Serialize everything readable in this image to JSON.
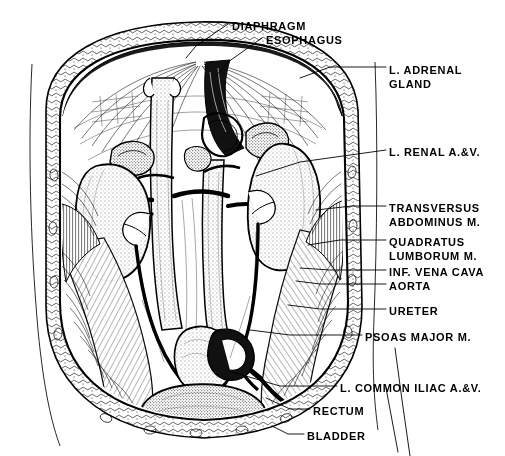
{
  "figure": {
    "kind": "anatomical-illustration",
    "style": "pen-and-ink line drawing, stippled and hatched"
  },
  "labels": [
    {
      "id": "diaphragm",
      "text": "DIAPHRAGM",
      "x": 232,
      "y": 20,
      "anchor": "start"
    },
    {
      "id": "esophagus",
      "text": "ESOPHAGUS",
      "x": 266,
      "y": 34,
      "anchor": "start"
    },
    {
      "id": "adrenal-1",
      "text": "L. ADRENAL",
      "x": 389,
      "y": 64,
      "anchor": "start"
    },
    {
      "id": "adrenal-2",
      "text": "GLAND",
      "x": 389,
      "y": 78,
      "anchor": "start"
    },
    {
      "id": "renal-av",
      "text": "L. RENAL  A.&V.",
      "x": 389,
      "y": 152,
      "anchor": "start"
    },
    {
      "id": "transversus-1",
      "text": "TRANSVERSUS",
      "x": 389,
      "y": 208,
      "anchor": "start"
    },
    {
      "id": "transversus-2",
      "text": "ABDOMINUS M.",
      "x": 389,
      "y": 222,
      "anchor": "start"
    },
    {
      "id": "quadratus-1",
      "text": "QUADRATUS",
      "x": 389,
      "y": 242,
      "anchor": "start"
    },
    {
      "id": "quadratus-2",
      "text": "LUMBORUM M.",
      "x": 389,
      "y": 256,
      "anchor": "start"
    },
    {
      "id": "vena-cava",
      "text": "INF. VENA CAVA",
      "x": 389,
      "y": 272,
      "anchor": "start"
    },
    {
      "id": "aorta",
      "text": "AORTA",
      "x": 389,
      "y": 286,
      "anchor": "start"
    },
    {
      "id": "ureter",
      "text": "URETER",
      "x": 389,
      "y": 311,
      "anchor": "start"
    },
    {
      "id": "psoas",
      "text": "PSOAS MAJOR M.",
      "x": 365,
      "y": 337,
      "anchor": "start"
    },
    {
      "id": "common-iliac",
      "text": "L. COMMON ILIAC A.&V.",
      "x": 340,
      "y": 388,
      "anchor": "start"
    },
    {
      "id": "rectum",
      "text": "RECTUM",
      "x": 313,
      "y": 411,
      "anchor": "start"
    },
    {
      "id": "bladder",
      "text": "BLADDER",
      "x": 307,
      "y": 436,
      "anchor": "start"
    }
  ],
  "leaders": [
    {
      "id": "leader-diaphragm",
      "d": "M228,24 L196,46 L186,58"
    },
    {
      "id": "leader-esophagus",
      "d": "M262,38 L228,62 L216,76"
    },
    {
      "id": "leader-adrenal",
      "d": "M386,67 L330,67 L300,78"
    },
    {
      "id": "leader-renal",
      "d": "M386,150 L300,162 L256,176"
    },
    {
      "id": "leader-transversus",
      "d": "M386,206 L352,206 L316,210"
    },
    {
      "id": "leader-quadratus",
      "d": "M386,240 L340,240 L308,245"
    },
    {
      "id": "leader-venacava",
      "d": "M386,270 L330,270 L300,268"
    },
    {
      "id": "leader-aorta",
      "d": "M386,284 L320,284 L296,281"
    },
    {
      "id": "leader-ureter",
      "d": "M386,309 L320,309 L288,305"
    },
    {
      "id": "leader-psoas",
      "d": "M362,335 L290,335 L250,330"
    },
    {
      "id": "leader-iliac",
      "d": "M337,386 L280,386 L232,372"
    },
    {
      "id": "leader-rectum",
      "d": "M310,409 L290,409 L266,398"
    },
    {
      "id": "leader-bladder",
      "d": "M304,434 L288,434 L272,426"
    },
    {
      "id": "leader-long-right",
      "d": "M395,350 L402,400 L410,456"
    },
    {
      "id": "leader-iliac-down",
      "d": "M386,385 L392,420 L398,450"
    }
  ],
  "outlines": {
    "skin_left": {
      "id": "skin-left-contour",
      "d": "M32,64 C28,140 30,240 38,330 C44,392 52,424 60,446"
    },
    "skin_right": {
      "id": "skin-right-contour",
      "d": "M375,62 C378,140 377,240 374,318 C372,370 374,400 378,430"
    }
  },
  "structures": [
    {
      "id": "diaphragm-arch",
      "name": "diaphragm"
    },
    {
      "id": "esophagus-hiatus",
      "name": "esophagus"
    },
    {
      "id": "adrenal-left",
      "name": "left-adrenal-gland"
    },
    {
      "id": "adrenal-right",
      "name": "right-adrenal-gland"
    },
    {
      "id": "kidney-left",
      "name": "left-kidney"
    },
    {
      "id": "kidney-right",
      "name": "right-kidney"
    },
    {
      "id": "aorta-vessel",
      "name": "aorta"
    },
    {
      "id": "vena-cava-vessel",
      "name": "inferior-vena-cava"
    },
    {
      "id": "ureter-left",
      "name": "left-ureter"
    },
    {
      "id": "ureter-right",
      "name": "right-ureter"
    },
    {
      "id": "bladder-organ",
      "name": "urinary-bladder"
    },
    {
      "id": "rectum-organ",
      "name": "rectum"
    },
    {
      "id": "psoas-left",
      "name": "psoas-major-left"
    },
    {
      "id": "psoas-right",
      "name": "psoas-major-right"
    },
    {
      "id": "quadratus-left",
      "name": "quadratus-lumborum-left"
    },
    {
      "id": "quadratus-right",
      "name": "quadratus-lumborum-right"
    },
    {
      "id": "transversus-left",
      "name": "transversus-abdominus-left"
    },
    {
      "id": "transversus-right",
      "name": "transversus-abdominus-right"
    },
    {
      "id": "iliac-vessels",
      "name": "common-iliac-vessels"
    },
    {
      "id": "body-wall",
      "name": "abdominal-body-wall"
    }
  ],
  "colors": {
    "ink": "#000000",
    "paper": "#ffffff"
  }
}
